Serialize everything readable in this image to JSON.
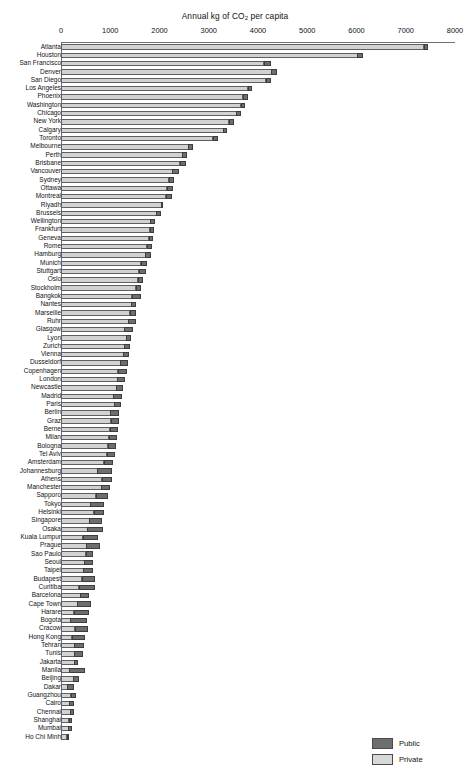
{
  "chart_data": {
    "type": "bar",
    "orientation": "horizontal",
    "stacked": true,
    "title": "Annual kg of CO2 per capita",
    "title_prefix": "Annual kg of CO",
    "title_subscript": "2",
    "title_suffix": " per capita",
    "xlabel": "",
    "ylabel": "",
    "xlim": [
      0,
      8000
    ],
    "xticks": [
      0,
      1000,
      2000,
      3000,
      4000,
      5000,
      6000,
      7000,
      8000
    ],
    "grid": false,
    "legend_position": "bottom-right",
    "series": [
      {
        "name": "Private",
        "color": "#d2d2d2"
      },
      {
        "name": "Public",
        "color": "#6e6e6e"
      }
    ],
    "categories": [
      "Atlanta",
      "Houston",
      "San Francisco",
      "Denver",
      "San Diego",
      "Los Angeles",
      "Phoenix",
      "Washington",
      "Chicago",
      "New York",
      "Calgary",
      "Toronto",
      "Melbourne",
      "Perth",
      "Brisbane",
      "Vancouver",
      "Sydney",
      "Ottawa",
      "Montreal",
      "Riyadh",
      "Brussels",
      "Wellington",
      "Frankfurt",
      "Geneva",
      "Rome",
      "Hamburg",
      "Munich",
      "Stuttgart",
      "Oslo",
      "Stockholm",
      "Bangkok",
      "Nantes",
      "Marseille",
      "Ruhr",
      "Glasgow",
      "Lyon",
      "Zurich",
      "Vienna",
      "Dusseldorf",
      "Copenhagen",
      "London",
      "Newcastle",
      "Madrid",
      "Paris",
      "Berlin",
      "Graz",
      "Berne",
      "Milan",
      "Bologna",
      "Tel Aviv",
      "Amsterdam",
      "Johannesburg",
      "Athens",
      "Manchester",
      "Sapporo",
      "Tokyo",
      "Helsinki",
      "Singapore",
      "Osaka",
      "Kuala Lumpur",
      "Prague",
      "Sao Paulo",
      "Seoul",
      "Taipei",
      "Budapest",
      "Curitiba",
      "Barcelona",
      "Cape Town",
      "Harare",
      "Bogota",
      "Cracow",
      "Hong Kong",
      "Tehran",
      "Tunis",
      "Jakarta",
      "Manila",
      "Beijing",
      "Dakar",
      "Guangzhou",
      "Cairo",
      "Chennai",
      "Shanghai",
      "Mumbai",
      "Ho Chi Minh"
    ],
    "private_values": [
      7380,
      6030,
      4130,
      4280,
      4170,
      3800,
      3700,
      3660,
      3570,
      3420,
      3310,
      3090,
      2590,
      2470,
      2420,
      2270,
      2200,
      2160,
      2140,
      2060,
      1940,
      1820,
      1810,
      1790,
      1750,
      1720,
      1630,
      1590,
      1570,
      1530,
      1450,
      1440,
      1410,
      1380,
      1300,
      1330,
      1300,
      1280,
      1210,
      1160,
      1150,
      1130,
      1070,
      1090,
      1010,
      1020,
      1000,
      980,
      960,
      940,
      880,
      750,
      840,
      830,
      720,
      600,
      680,
      580,
      540,
      450,
      520,
      510,
      480,
      460,
      430,
      370,
      400,
      340,
      270,
      200,
      290,
      230,
      280,
      280,
      280,
      180,
      260,
      140,
      210,
      180,
      200,
      170,
      160,
      130
    ],
    "public_values": [
      80,
      110,
      140,
      110,
      110,
      90,
      100,
      80,
      100,
      110,
      70,
      110,
      110,
      110,
      130,
      130,
      100,
      120,
      130,
      20,
      110,
      110,
      100,
      100,
      110,
      110,
      130,
      150,
      110,
      100,
      180,
      90,
      130,
      150,
      170,
      110,
      120,
      120,
      160,
      190,
      160,
      150,
      190,
      150,
      190,
      170,
      160,
      170,
      160,
      160,
      190,
      300,
      200,
      170,
      250,
      280,
      210,
      270,
      320,
      320,
      280,
      150,
      190,
      200,
      270,
      330,
      180,
      280,
      320,
      330,
      270,
      270,
      200,
      180,
      80,
      310,
      110,
      130,
      110,
      90,
      80,
      70,
      70,
      40
    ],
    "total_values": [
      7460,
      6140,
      4270,
      4390,
      4280,
      3890,
      3800,
      3740,
      3670,
      3530,
      3380,
      3200,
      2700,
      2580,
      2550,
      2400,
      2300,
      2280,
      2270,
      2080,
      2050,
      1930,
      1910,
      1890,
      1860,
      1830,
      1760,
      1740,
      1680,
      1630,
      1630,
      1530,
      1540,
      1530,
      1470,
      1440,
      1420,
      1400,
      1370,
      1350,
      1310,
      1280,
      1260,
      1240,
      1200,
      1190,
      1160,
      1150,
      1120,
      1100,
      1070,
      1050,
      1040,
      1000,
      970,
      880,
      890,
      850,
      860,
      770,
      800,
      660,
      670,
      660,
      700,
      700,
      580,
      620,
      590,
      530,
      560,
      500,
      480,
      460,
      360,
      570,
      370,
      270,
      320,
      270,
      280,
      240,
      230,
      170
    ]
  },
  "legend": {
    "items": [
      {
        "label": "Public",
        "swatch_class": "sw-public",
        "icon": "legend-swatch-public"
      },
      {
        "label": "Private",
        "swatch_class": "sw-private",
        "icon": "legend-swatch-private"
      }
    ]
  }
}
